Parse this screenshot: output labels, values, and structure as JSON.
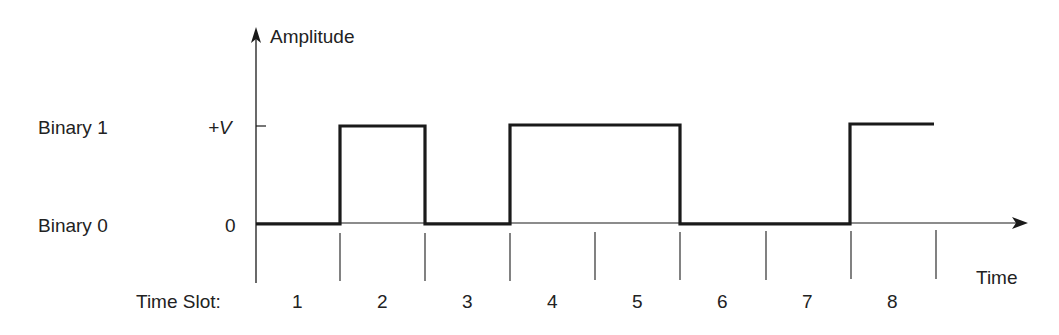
{
  "diagram": {
    "axes": {
      "y_label": "Amplitude",
      "x_label": "Time",
      "y_tick_high": "+V",
      "y_tick_low": "0"
    },
    "levels": {
      "high_label": "Binary 1",
      "low_label": "Binary 0"
    },
    "time_slot_prefix": "Time Slot:",
    "time_slots": [
      "1",
      "2",
      "3",
      "4",
      "5",
      "6",
      "7",
      "8"
    ],
    "bits": [
      0,
      1,
      0,
      1,
      1,
      0,
      0,
      1
    ],
    "colors": {
      "line": "#1a1a1a",
      "text": "#222222",
      "background": "#ffffff"
    }
  }
}
